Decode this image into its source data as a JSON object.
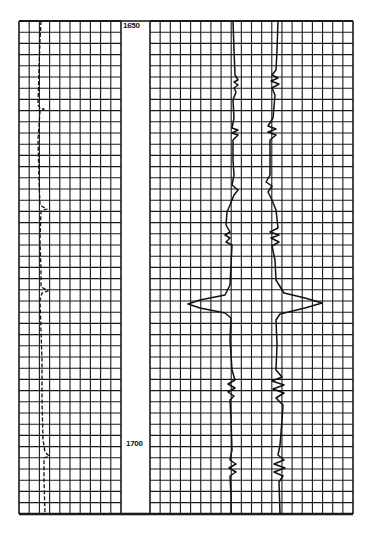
{
  "chart_data": {
    "type": "line",
    "title": "",
    "subtitle": "",
    "xlabel": "",
    "ylabel": "Depth",
    "ylim": [
      1625,
      1735
    ],
    "grid": true,
    "legend": null,
    "depth_labels": [
      {
        "text": "1650",
        "depth": 1650
      },
      {
        "text": "1700",
        "depth": 1700
      }
    ],
    "tracks": [
      {
        "name": "left-track",
        "x_range": [
          19,
          121
        ],
        "v_lines": 10,
        "series": [
          {
            "name": "curve-1 (dashed)",
            "style": "dashed",
            "points": [
              [
                41,
                21
              ],
              [
                40,
                40
              ],
              [
                39,
                70
              ],
              [
                38,
                105
              ],
              [
                40,
                108
              ],
              [
                44,
                109
              ],
              [
                40,
                111
              ],
              [
                38,
                140
              ],
              [
                39,
                180
              ],
              [
                40,
                205
              ],
              [
                43,
                207
              ],
              [
                47,
                209
              ],
              [
                41,
                211
              ],
              [
                40,
                240
              ],
              [
                41,
                270
              ],
              [
                41,
                287
              ],
              [
                45,
                289
              ],
              [
                48,
                291
              ],
              [
                42,
                293
              ],
              [
                40,
                300
              ],
              [
                41,
                330
              ],
              [
                42,
                360
              ],
              [
                42,
                400
              ],
              [
                43,
                440
              ],
              [
                45,
                452
              ],
              [
                49,
                456
              ],
              [
                44,
                458
              ],
              [
                44,
                480
              ],
              [
                45,
                514
              ]
            ]
          }
        ]
      },
      {
        "name": "right-track",
        "x_range": [
          150,
          353
        ],
        "v_lines": 20,
        "series": [
          {
            "name": "curve-left",
            "style": "solid",
            "points": [
              [
                233,
                21
              ],
              [
                234,
                50
              ],
              [
                235,
                75
              ],
              [
                238,
                80
              ],
              [
                234,
                82
              ],
              [
                238,
                85
              ],
              [
                234,
                88
              ],
              [
                236,
                92
              ],
              [
                233,
                100
              ],
              [
                234,
                118
              ],
              [
                232,
                128
              ],
              [
                238,
                130
              ],
              [
                232,
                133
              ],
              [
                238,
                135
              ],
              [
                233,
                140
              ],
              [
                233,
                160
              ],
              [
                234,
                175
              ],
              [
                232,
                185
              ],
              [
                238,
                190
              ],
              [
                234,
                195
              ],
              [
                230,
                205
              ],
              [
                227,
                212
              ],
              [
                226,
                225
              ],
              [
                230,
                232
              ],
              [
                225,
                235
              ],
              [
                230,
                238
              ],
              [
                226,
                242
              ],
              [
                232,
                245
              ],
              [
                231,
                265
              ],
              [
                230,
                285
              ],
              [
                225,
                295
              ],
              [
                200,
                300
              ],
              [
                188,
                304
              ],
              [
                200,
                308
              ],
              [
                225,
                313
              ],
              [
                231,
                318
              ],
              [
                230,
                340
              ],
              [
                232,
                370
              ],
              [
                235,
                380
              ],
              [
                228,
                384
              ],
              [
                235,
                388
              ],
              [
                228,
                392
              ],
              [
                234,
                396
              ],
              [
                230,
                400
              ],
              [
                231,
                420
              ],
              [
                232,
                450
              ],
              [
                230,
                460
              ],
              [
                236,
                464
              ],
              [
                229,
                468
              ],
              [
                236,
                472
              ],
              [
                230,
                476
              ],
              [
                231,
                495
              ],
              [
                231,
                514
              ]
            ]
          },
          {
            "name": "curve-right",
            "style": "solid",
            "points": [
              [
                278,
                21
              ],
              [
                277,
                50
              ],
              [
                276,
                70
              ],
              [
                272,
                75
              ],
              [
                278,
                78
              ],
              [
                271,
                81
              ],
              [
                279,
                84
              ],
              [
                272,
                88
              ],
              [
                275,
                95
              ],
              [
                273,
                118
              ],
              [
                268,
                126
              ],
              [
                276,
                129
              ],
              [
                268,
                132
              ],
              [
                276,
                135
              ],
              [
                270,
                140
              ],
              [
                270,
                160
              ],
              [
                270,
                175
              ],
              [
                266,
                182
              ],
              [
                272,
                186
              ],
              [
                268,
                192
              ],
              [
                272,
                200
              ],
              [
                276,
                210
              ],
              [
                278,
                228
              ],
              [
                270,
                232
              ],
              [
                279,
                235
              ],
              [
                271,
                238
              ],
              [
                279,
                242
              ],
              [
                272,
                246
              ],
              [
                275,
                260
              ],
              [
                276,
                280
              ],
              [
                284,
                293
              ],
              [
                305,
                298
              ],
              [
                322,
                303
              ],
              [
                305,
                308
              ],
              [
                280,
                314
              ],
              [
                276,
                320
              ],
              [
                277,
                345
              ],
              [
                276,
                370
              ],
              [
                282,
                377
              ],
              [
                272,
                381
              ],
              [
                284,
                385
              ],
              [
                273,
                389
              ],
              [
                284,
                393
              ],
              [
                276,
                398
              ],
              [
                283,
                405
              ],
              [
                282,
                420
              ],
              [
                280,
                445
              ],
              [
                278,
                455
              ],
              [
                284,
                460
              ],
              [
                274,
                464
              ],
              [
                285,
                468
              ],
              [
                274,
                472
              ],
              [
                283,
                476
              ],
              [
                279,
                482
              ],
              [
                280,
                514
              ]
            ]
          }
        ]
      }
    ]
  },
  "colors": {
    "grid": "#1a1a1a",
    "curve": "#111111",
    "background": "#ffffff",
    "paper_noise": "#cfcfcf"
  }
}
